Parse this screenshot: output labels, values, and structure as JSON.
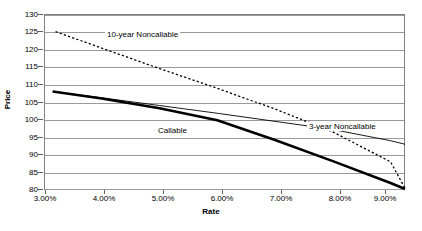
{
  "chart_data": {
    "type": "line",
    "title": "",
    "subtitle": "",
    "xlabel": "Rate",
    "ylabel": "Price",
    "xlim": [
      3.0,
      9.25
    ],
    "ylim": [
      80,
      130
    ],
    "grid": true,
    "legend_position": "inline-annotations",
    "x_tick_labels": [
      "3.00%",
      "4.00%",
      "5.00%",
      "6.00%",
      "7.00%",
      "8.00%",
      "9.00%"
    ],
    "x_tick_values": [
      3.0,
      4.0,
      5.0,
      6.0,
      7.0,
      8.0,
      9.0
    ],
    "y_tick_labels": [
      "80",
      "85",
      "90",
      "95",
      "100",
      "105",
      "110",
      "115",
      "120",
      "125",
      "130"
    ],
    "y_tick_values": [
      80,
      85,
      90,
      95,
      100,
      105,
      110,
      115,
      120,
      125,
      130
    ],
    "series": [
      {
        "name": "10-year Noncallable",
        "style": "dashed",
        "annotation": "10-year Noncallable",
        "x": [
          3.2,
          4.0,
          5.0,
          6.0,
          7.0,
          8.0,
          9.0,
          9.25
        ],
        "values": [
          125.0,
          120.3,
          114.5,
          108.9,
          103.0,
          96.5,
          88.0,
          80.5
        ]
      },
      {
        "name": "Callable",
        "style": "bold-solid",
        "annotation": "Callable",
        "x": [
          3.15,
          4.0,
          5.0,
          6.0,
          7.0,
          8.0,
          9.0,
          9.25
        ],
        "values": [
          108.0,
          106.0,
          103.2,
          99.8,
          94.2,
          88.2,
          82.0,
          80.3
        ]
      },
      {
        "name": "3-year Noncallable",
        "style": "thin-solid",
        "annotation": "3-year Noncallable",
        "x": [
          3.15,
          4.0,
          5.0,
          6.0,
          7.0,
          8.0,
          9.0,
          9.25
        ],
        "values": [
          108.0,
          106.2,
          104.0,
          101.8,
          99.5,
          97.2,
          94.0,
          93.0
        ]
      }
    ]
  },
  "axis": {
    "y_title": "Price",
    "x_title": "Rate"
  },
  "annotations": {
    "ten_year": "10-year Noncallable",
    "callable": "Callable",
    "three_year": "3-year Noncallable"
  },
  "colors": {
    "background": "#ffffff",
    "axis": "#808080",
    "grid": "#9a9a9a",
    "series": "#000000"
  }
}
